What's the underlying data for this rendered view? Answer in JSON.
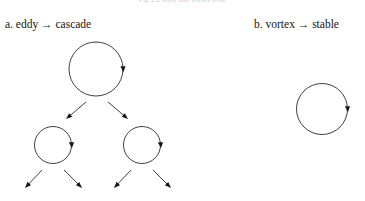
{
  "figure": {
    "caption_top": "Fig 2.2    eddy and vortex flow",
    "background_color": "#ffffff",
    "stroke_color": "#2b2b2b",
    "width": 365,
    "height": 201
  },
  "panels": [
    {
      "id": "a",
      "label": "a. eddy → cascade",
      "label_x": 5,
      "label_y": 18,
      "loop_direction": "clockwise",
      "circles": [
        {
          "name": "parent-eddy",
          "cx": 96,
          "cy": 69,
          "r": 27
        },
        {
          "name": "child-eddy-left",
          "cx": 53,
          "cy": 145,
          "r": 18.5
        },
        {
          "name": "child-eddy-right",
          "cx": 142,
          "cy": 145,
          "r": 18.5
        }
      ],
      "branches": [
        {
          "name": "branch-parent-left",
          "x1": 86,
          "y1": 102,
          "x2": 66,
          "y2": 119
        },
        {
          "name": "branch-parent-right",
          "x1": 108,
          "y1": 102,
          "x2": 128,
          "y2": 119
        },
        {
          "name": "branch-left-child-left",
          "x1": 42,
          "y1": 170,
          "x2": 25,
          "y2": 188
        },
        {
          "name": "branch-left-child-right",
          "x1": 64,
          "y1": 170,
          "x2": 82,
          "y2": 188
        },
        {
          "name": "branch-right-child-left",
          "x1": 131,
          "y1": 170,
          "x2": 114,
          "y2": 188
        },
        {
          "name": "branch-right-child-right",
          "x1": 153,
          "y1": 170,
          "x2": 171,
          "y2": 188
        }
      ]
    },
    {
      "id": "b",
      "label": "b. vortex → stable",
      "label_x": 254,
      "label_y": 18,
      "loop_direction": "clockwise",
      "circles": [
        {
          "name": "stable-vortex",
          "cx": 322,
          "cy": 109,
          "r": 25.5
        }
      ],
      "branches": []
    }
  ]
}
